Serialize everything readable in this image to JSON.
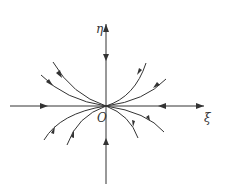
{
  "diagram": {
    "type": "phase-portrait",
    "colors": {
      "stroke": "#333333",
      "background": "#ffffff"
    },
    "axes": {
      "horizontal_label": "ξ",
      "vertical_label": "η",
      "origin_label": "O"
    }
  }
}
